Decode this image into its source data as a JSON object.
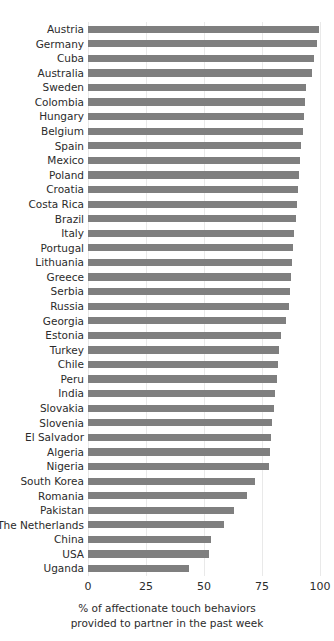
{
  "chart_data": {
    "type": "bar",
    "orientation": "horizontal",
    "title": "",
    "subtitle": "",
    "xlabel_lines": [
      "% of affectionate touch behaviors",
      "provided to partner in the past week"
    ],
    "ylabel": "",
    "xlim": [
      0,
      100
    ],
    "xticks": [
      0,
      25,
      50,
      75,
      100
    ],
    "xticklabels": [
      "0",
      "25",
      "50",
      "75",
      "100"
    ],
    "grid": true,
    "grid_axis": "x",
    "legend": null,
    "bar_color": "#7f7f7f",
    "categories": [
      "Austria",
      "Germany",
      "Cuba",
      "Australia",
      "Sweden",
      "Colombia",
      "Hungary",
      "Belgium",
      "Spain",
      "Mexico",
      "Poland",
      "Croatia",
      "Costa Rica",
      "Brazil",
      "Italy",
      "Portugal",
      "Lithuania",
      "Greece",
      "Serbia",
      "Russia",
      "Georgia",
      "Estonia",
      "Turkey",
      "Chile",
      "Peru",
      "India",
      "Slovakia",
      "Slovenia",
      "El Salvador",
      "Algeria",
      "Nigeria",
      "South Korea",
      "Romania",
      "Pakistan",
      "The Netherlands",
      "China",
      "USA",
      "Uganda"
    ],
    "values": [
      99.5,
      98.5,
      97.5,
      96.5,
      94.0,
      93.5,
      93.0,
      92.5,
      92.0,
      91.5,
      91.0,
      90.5,
      90.0,
      89.5,
      89.0,
      88.5,
      88.0,
      87.5,
      87.0,
      86.5,
      85.5,
      83.0,
      82.5,
      82.0,
      81.5,
      80.5,
      80.0,
      79.5,
      79.0,
      78.5,
      78.0,
      72.0,
      68.5,
      63.0,
      58.5,
      53.0,
      52.0,
      43.5
    ]
  }
}
